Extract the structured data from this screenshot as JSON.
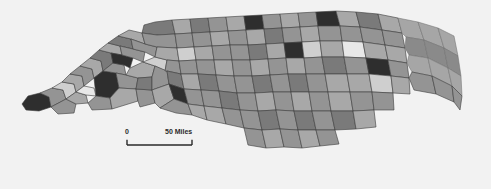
{
  "figure": {
    "kind": "choropleth-map",
    "region": "North Carolina counties",
    "background_color": "#f2f2f2"
  },
  "scale_bar": {
    "name": "map-scale-bar",
    "zero_label": "0",
    "max_label": "50 Miles",
    "unit": "Miles",
    "max_value": "50"
  },
  "chart_data": {
    "type": "heatmap",
    "title": "",
    "xlabel": "",
    "ylabel": "",
    "legend_position": "none",
    "grid": false,
    "palette": {
      "darkest": "#2e2e2e",
      "dark": "#5e5e5e",
      "mid_dark": "#7a7a7a",
      "mid": "#949494",
      "mid_light": "#a8a8a8",
      "light": "#cfcfcf",
      "lightest": "#e8e8e8",
      "water": "#a6a6a6",
      "water_dark": "#8a8a8a",
      "outline": "#3c3c3c"
    },
    "class_count": 7,
    "categories": [
      "class-1-darkest",
      "class-2-dark",
      "class-3-mid-dark",
      "class-4-mid",
      "class-5-mid-light",
      "class-6-light",
      "class-7-lightest"
    ],
    "values": [
      9,
      11,
      18,
      34,
      14,
      8,
      6
    ],
    "regions": [
      {
        "id": "c01",
        "fill": "#2e2e2e",
        "pts": "22,104 28,96 40,93 49,97 51,107 39,111 26,110"
      },
      {
        "id": "c02",
        "fill": "#949494",
        "pts": "40,93 52,88 63,90 66,99 51,107 49,97"
      },
      {
        "id": "c03",
        "fill": "#cfcfcf",
        "pts": "52,88 62,82 74,84 76,92 66,99 63,90"
      },
      {
        "id": "c04",
        "fill": "#a8a8a8",
        "pts": "62,82 70,74 82,76 84,86 76,92 74,84"
      },
      {
        "id": "c05",
        "fill": "#949494",
        "pts": "51,107 66,99 76,104 74,113 58,114"
      },
      {
        "id": "c06",
        "fill": "#a8a8a8",
        "pts": "66,99 76,92 86,95 88,103 76,104"
      },
      {
        "id": "c07",
        "fill": "#e8e8e8",
        "pts": "76,92 84,86 94,88 96,96 86,95"
      },
      {
        "id": "c08",
        "fill": "#949494",
        "pts": "70,74 80,66 92,69 94,78 84,86 82,76"
      },
      {
        "id": "c09",
        "fill": "#a8a8a8",
        "pts": "80,66 90,58 101,61 103,71 94,78 92,69"
      },
      {
        "id": "c10",
        "fill": "#2e2e2e",
        "pts": "96,96 94,78 103,71 116,73 119,88 110,98"
      },
      {
        "id": "c11",
        "fill": "#949494",
        "pts": "88,103 96,96 110,98 112,109 92,110"
      },
      {
        "id": "c12",
        "fill": "#7a7a7a",
        "pts": "90,58 99,50 111,53 113,63 103,71 101,61"
      },
      {
        "id": "c13",
        "fill": "#949494",
        "pts": "103,71 113,63 124,65 126,75 116,73"
      },
      {
        "id": "c14",
        "fill": "#a8a8a8",
        "pts": "99,50 108,43 120,46 122,55 111,53"
      },
      {
        "id": "c15",
        "fill": "#2e2e2e",
        "pts": "111,53 122,55 133,58 130,68 124,65 113,63"
      },
      {
        "id": "c16",
        "fill": "#949494",
        "pts": "116,73 126,75 138,78 136,89 119,88"
      },
      {
        "id": "c17",
        "fill": "#a8a8a8",
        "pts": "110,98 119,88 136,89 138,101 112,109"
      },
      {
        "id": "c18",
        "fill": "#7a7a7a",
        "pts": "108,43 118,36 131,39 133,49 120,46"
      },
      {
        "id": "c19",
        "fill": "#949494",
        "pts": "120,46 133,49 145,52 143,62 133,58 122,55"
      },
      {
        "id": "c20",
        "fill": "#a8a8a8",
        "pts": "130,68 143,62 155,66 152,77 138,78 126,75"
      },
      {
        "id": "c21",
        "fill": "#949494",
        "pts": "138,101 136,89 152,90 155,103 140,107"
      },
      {
        "id": "c22",
        "fill": "#7a7a7a",
        "pts": "136,89 138,78 152,77 152,90"
      },
      {
        "id": "c23",
        "fill": "#a8a8a8",
        "pts": "118,36 129,30 142,33 145,44 131,39"
      },
      {
        "id": "c24",
        "fill": "#949494",
        "pts": "131,39 145,44 157,47 155,57 145,52 133,49"
      },
      {
        "id": "c25",
        "fill": "#cfcfcf",
        "pts": "143,62 155,57 167,60 165,71 155,66"
      },
      {
        "id": "c26",
        "fill": "#949494",
        "pts": "152,77 155,66 167,71 169,84 152,90"
      },
      {
        "id": "c27",
        "fill": "#a8a8a8",
        "pts": "155,103 152,90 169,84 174,99 160,108"
      },
      {
        "id": "c28",
        "fill": "#7a7a7a",
        "pts": "155,22 172,20 175,34 157,35 142,33 144,25"
      },
      {
        "id": "c29",
        "fill": "#949494",
        "pts": "157,35 175,34 177,48 157,47 145,44 142,33"
      },
      {
        "id": "c30",
        "fill": "#a8a8a8",
        "pts": "157,47 177,48 179,61 167,60 155,57"
      },
      {
        "id": "c31",
        "fill": "#949494",
        "pts": "167,60 179,61 181,74 167,71 165,71"
      },
      {
        "id": "c32",
        "fill": "#7a7a7a",
        "pts": "167,71 181,74 184,89 169,84"
      },
      {
        "id": "c33",
        "fill": "#2e2e2e",
        "pts": "169,84 184,89 188,104 174,99"
      },
      {
        "id": "c34",
        "fill": "#949494",
        "pts": "174,99 188,104 192,115 176,113 160,108"
      },
      {
        "id": "c35",
        "fill": "#a8a8a8",
        "pts": "172,20 190,19 192,33 175,34"
      },
      {
        "id": "c36",
        "fill": "#949494",
        "pts": "175,34 192,33 194,47 177,48"
      },
      {
        "id": "c37",
        "fill": "#cfcfcf",
        "pts": "177,48 194,47 196,60 179,61"
      },
      {
        "id": "c38",
        "fill": "#949494",
        "pts": "179,61 196,60 198,74 181,74"
      },
      {
        "id": "c39",
        "fill": "#a8a8a8",
        "pts": "181,74 198,74 201,90 184,89"
      },
      {
        "id": "c40",
        "fill": "#949494",
        "pts": "184,89 201,90 204,106 188,104"
      },
      {
        "id": "c41",
        "fill": "#a8a8a8",
        "pts": "188,104 204,106 207,120 192,115"
      },
      {
        "id": "c42",
        "fill": "#7a7a7a",
        "pts": "190,19 208,18 210,32 192,33"
      },
      {
        "id": "c43",
        "fill": "#949494",
        "pts": "192,33 210,32 212,46 194,47"
      },
      {
        "id": "c44",
        "fill": "#a8a8a8",
        "pts": "194,47 212,46 214,60 196,60"
      },
      {
        "id": "c45",
        "fill": "#949494",
        "pts": "196,60 214,60 216,75 198,74"
      },
      {
        "id": "c46",
        "fill": "#7a7a7a",
        "pts": "198,74 216,75 219,91 201,90"
      },
      {
        "id": "c47",
        "fill": "#949494",
        "pts": "201,90 219,91 222,108 204,106"
      },
      {
        "id": "c48",
        "fill": "#a8a8a8",
        "pts": "204,106 222,108 226,124 207,120"
      },
      {
        "id": "c49",
        "fill": "#949494",
        "pts": "208,18 226,17 228,31 210,32"
      },
      {
        "id": "c50",
        "fill": "#a8a8a8",
        "pts": "210,32 228,31 230,45 212,46"
      },
      {
        "id": "c51",
        "fill": "#949494",
        "pts": "212,46 230,45 232,60 214,60"
      },
      {
        "id": "c52",
        "fill": "#a8a8a8",
        "pts": "214,60 232,60 234,76 216,75"
      },
      {
        "id": "c53",
        "fill": "#949494",
        "pts": "216,75 234,76 237,93 219,91"
      },
      {
        "id": "c54",
        "fill": "#7a7a7a",
        "pts": "219,91 237,93 240,110 222,108"
      },
      {
        "id": "c55",
        "fill": "#949494",
        "pts": "222,108 240,110 244,128 226,124"
      },
      {
        "id": "c56",
        "fill": "#a8a8a8",
        "pts": "226,17 244,16 246,30 228,31"
      },
      {
        "id": "c57",
        "fill": "#2e2e2e",
        "pts": "244,16 262,15 264,29 246,30"
      },
      {
        "id": "c58",
        "fill": "#949494",
        "pts": "228,31 246,30 248,45 230,45"
      },
      {
        "id": "c59",
        "fill": "#a8a8a8",
        "pts": "246,30 264,29 266,44 248,45"
      },
      {
        "id": "c60",
        "fill": "#949494",
        "pts": "230,45 248,45 250,60 232,60"
      },
      {
        "id": "c61",
        "fill": "#7a7a7a",
        "pts": "248,45 266,44 268,59 250,60"
      },
      {
        "id": "c62",
        "fill": "#949494",
        "pts": "232,60 250,60 252,76 234,76"
      },
      {
        "id": "c63",
        "fill": "#a8a8a8",
        "pts": "250,60 268,59 270,75 252,76"
      },
      {
        "id": "c64",
        "fill": "#949494",
        "pts": "234,76 252,76 255,93 237,93"
      },
      {
        "id": "c65",
        "fill": "#7a7a7a",
        "pts": "252,76 270,75 273,92 255,93"
      },
      {
        "id": "c66",
        "fill": "#949494",
        "pts": "237,93 255,93 258,111 240,110"
      },
      {
        "id": "c67",
        "fill": "#a8a8a8",
        "pts": "255,93 273,92 276,110 258,111"
      },
      {
        "id": "c68",
        "fill": "#949494",
        "pts": "240,110 258,111 262,130 244,128"
      },
      {
        "id": "c69",
        "fill": "#7a7a7a",
        "pts": "258,111 276,110 280,129 262,130"
      },
      {
        "id": "c70",
        "fill": "#949494",
        "pts": "244,128 262,130 266,148 248,145"
      },
      {
        "id": "c71",
        "fill": "#a8a8a8",
        "pts": "262,130 280,129 284,147 266,148"
      },
      {
        "id": "c72",
        "fill": "#949494",
        "pts": "262,15 280,14 282,28 264,29"
      },
      {
        "id": "c73",
        "fill": "#a8a8a8",
        "pts": "280,14 298,13 300,27 282,28"
      },
      {
        "id": "c74",
        "fill": "#7a7a7a",
        "pts": "264,29 282,28 284,43 266,44"
      },
      {
        "id": "c75",
        "fill": "#949494",
        "pts": "282,28 300,27 302,42 284,43"
      },
      {
        "id": "c76",
        "fill": "#a8a8a8",
        "pts": "266,44 284,43 286,58 268,59"
      },
      {
        "id": "c77",
        "fill": "#2e2e2e",
        "pts": "284,43 302,42 304,58 286,58"
      },
      {
        "id": "c78",
        "fill": "#949494",
        "pts": "268,59 286,58 288,74 270,75"
      },
      {
        "id": "c79",
        "fill": "#a8a8a8",
        "pts": "286,58 304,58 306,74 288,74"
      },
      {
        "id": "c80",
        "fill": "#949494",
        "pts": "270,75 288,74 291,92 273,92"
      },
      {
        "id": "c81",
        "fill": "#7a7a7a",
        "pts": "288,74 306,74 309,92 291,92"
      },
      {
        "id": "c82",
        "fill": "#949494",
        "pts": "273,92 291,92 294,111 276,110"
      },
      {
        "id": "c83",
        "fill": "#a8a8a8",
        "pts": "291,92 309,92 312,111 294,111"
      },
      {
        "id": "c84",
        "fill": "#949494",
        "pts": "276,110 294,111 298,130 280,129"
      },
      {
        "id": "c85",
        "fill": "#7a7a7a",
        "pts": "294,111 312,111 316,130 298,130"
      },
      {
        "id": "c86",
        "fill": "#949494",
        "pts": "280,129 298,130 302,148 284,147"
      },
      {
        "id": "c87",
        "fill": "#a8a8a8",
        "pts": "298,130 316,130 320,146 302,148"
      },
      {
        "id": "c88",
        "fill": "#949494",
        "pts": "298,13 316,12 318,26 300,27"
      },
      {
        "id": "c89",
        "fill": "#2e2e2e",
        "pts": "316,12 336,11 340,26 318,26"
      },
      {
        "id": "c90",
        "fill": "#a8a8a8",
        "pts": "300,27 318,26 320,41 302,42"
      },
      {
        "id": "c91",
        "fill": "#949494",
        "pts": "318,26 340,26 342,41 320,41"
      },
      {
        "id": "c92",
        "fill": "#cfcfcf",
        "pts": "302,42 320,41 322,57 304,58"
      },
      {
        "id": "c93",
        "fill": "#a8a8a8",
        "pts": "320,41 342,41 344,57 322,57"
      },
      {
        "id": "c94",
        "fill": "#949494",
        "pts": "304,58 322,57 325,74 306,74"
      },
      {
        "id": "c95",
        "fill": "#7a7a7a",
        "pts": "322,57 344,57 347,74 325,74"
      },
      {
        "id": "c96",
        "fill": "#949494",
        "pts": "306,74 325,74 328,92 309,92"
      },
      {
        "id": "c97",
        "fill": "#a8a8a8",
        "pts": "325,74 347,74 350,92 328,92"
      },
      {
        "id": "c98",
        "fill": "#949494",
        "pts": "309,92 328,92 331,111 312,111"
      },
      {
        "id": "c99",
        "fill": "#a8a8a8",
        "pts": "328,92 350,92 353,111 331,111"
      },
      {
        "id": "c100",
        "fill": "#949494",
        "pts": "312,111 331,111 335,130 316,130"
      },
      {
        "id": "c101",
        "fill": "#7a7a7a",
        "pts": "331,111 353,111 356,129 335,130"
      },
      {
        "id": "c102",
        "fill": "#949494",
        "pts": "316,130 335,130 339,144 320,146"
      },
      {
        "id": "c103",
        "fill": "#a8a8a8",
        "pts": "336,11 356,12 360,27 340,26"
      },
      {
        "id": "c104",
        "fill": "#949494",
        "pts": "340,26 360,27 363,42 342,41"
      },
      {
        "id": "c105",
        "fill": "#e8e8e8",
        "pts": "342,41 363,42 366,58 344,57"
      },
      {
        "id": "c106",
        "fill": "#949494",
        "pts": "344,57 366,58 369,74 347,74"
      },
      {
        "id": "c107",
        "fill": "#a8a8a8",
        "pts": "347,74 369,74 372,92 350,92"
      },
      {
        "id": "c108",
        "fill": "#949494",
        "pts": "350,92 372,92 374,110 353,111"
      },
      {
        "id": "c109",
        "fill": "#a8a8a8",
        "pts": "353,111 374,110 376,127 356,129"
      },
      {
        "id": "c110",
        "fill": "#7a7a7a",
        "pts": "356,12 378,14 382,30 360,27"
      },
      {
        "id": "c111",
        "fill": "#949494",
        "pts": "360,27 382,30 385,45 363,42"
      },
      {
        "id": "c112",
        "fill": "#a8a8a8",
        "pts": "363,42 385,45 388,60 366,58"
      },
      {
        "id": "c113",
        "fill": "#2e2e2e",
        "pts": "366,58 388,60 391,76 369,74"
      },
      {
        "id": "c114",
        "fill": "#cfcfcf",
        "pts": "369,74 391,76 393,93 372,92"
      },
      {
        "id": "c115",
        "fill": "#949494",
        "pts": "372,92 393,93 394,110 374,110"
      },
      {
        "id": "c116",
        "fill": "#a8a8a8",
        "pts": "378,14 398,18 402,33 382,30"
      },
      {
        "id": "c117",
        "fill": "#949494",
        "pts": "382,30 402,33 405,48 385,45"
      },
      {
        "id": "c118",
        "fill": "#a8a8a8",
        "pts": "385,45 405,48 407,63 388,60"
      },
      {
        "id": "c119",
        "fill": "#949494",
        "pts": "388,60 407,63 409,78 391,76"
      },
      {
        "id": "c120",
        "fill": "#a8a8a8",
        "pts": "391,76 409,78 410,94 393,93"
      },
      {
        "id": "c121",
        "fill": "#a6a6a6",
        "pts": "398,18 418,22 424,40 406,37 402,33"
      },
      {
        "id": "c122",
        "fill": "#8a8a8a",
        "pts": "406,37 424,40 428,58 409,55 405,48"
      },
      {
        "id": "c123",
        "fill": "#a6a6a6",
        "pts": "409,55 428,58 432,76 412,72 407,63"
      },
      {
        "id": "c124",
        "fill": "#949494",
        "pts": "412,72 432,76 436,94 414,90 409,78"
      },
      {
        "id": "c125",
        "fill": "#a6a6a6",
        "pts": "418,22 438,28 444,48 424,40"
      },
      {
        "id": "c126",
        "fill": "#8a8a8a",
        "pts": "424,40 444,48 448,68 428,58"
      },
      {
        "id": "c127",
        "fill": "#a6a6a6",
        "pts": "428,58 448,68 452,86 432,76"
      },
      {
        "id": "c128",
        "fill": "#949494",
        "pts": "432,76 452,86 454,102 436,94"
      },
      {
        "id": "c129",
        "fill": "#a6a6a6",
        "pts": "438,28 454,36 458,56 444,48"
      },
      {
        "id": "c130",
        "fill": "#8a8a8a",
        "pts": "444,48 458,56 461,76 448,68"
      },
      {
        "id": "c131",
        "fill": "#a6a6a6",
        "pts": "448,68 461,76 462,96 452,86"
      },
      {
        "id": "c132",
        "fill": "#949494",
        "pts": "452,86 462,96 460,110 454,102"
      }
    ]
  }
}
